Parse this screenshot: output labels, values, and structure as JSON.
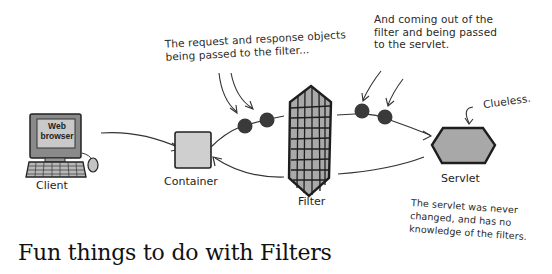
{
  "annotations": {
    "request_response": [
      "The request and response objects",
      "being passed to the filter..."
    ],
    "coming_out": [
      "And coming out of the",
      "filter and being passed",
      "to the servlet."
    ],
    "clueless": "Clueless.",
    "servlet_note": [
      "The servlet was never",
      "changed, and has no",
      "knowledge of the filters."
    ]
  },
  "nodes": {
    "client": {
      "label": "Client",
      "screen_text": [
        "Web",
        "browser"
      ]
    },
    "container": {
      "label": "Container"
    },
    "filter": {
      "label": "Filter"
    },
    "servlet": {
      "label": "Servlet"
    }
  },
  "title": "Fun things to do with Filters",
  "colors": {
    "box_fill": "#cfcfcf",
    "filter_fill": "#a9a9a9",
    "servlet_fill": "#a8a8a8",
    "ball": "#3a3a3a",
    "line": "#333333"
  }
}
